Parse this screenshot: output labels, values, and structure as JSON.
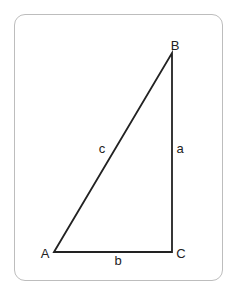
{
  "diagram": {
    "type": "right-triangle",
    "vertices": {
      "A": {
        "label": "A",
        "x": 54,
        "y": 252
      },
      "B": {
        "label": "B",
        "x": 172,
        "y": 53
      },
      "C": {
        "label": "C",
        "x": 172,
        "y": 252
      }
    },
    "sides": {
      "a": {
        "label": "a",
        "from": "B",
        "to": "C"
      },
      "b": {
        "label": "b",
        "from": "A",
        "to": "C"
      },
      "c": {
        "label": "c",
        "from": "A",
        "to": "B"
      }
    },
    "right_angle_at": "C",
    "colors": {
      "line": "#222222",
      "frame_border": "#bdbdbd",
      "background": "#ffffff"
    }
  }
}
